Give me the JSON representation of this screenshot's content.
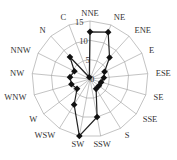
{
  "chart_data": {
    "type": "radar",
    "title": "",
    "categories": [
      "NNE",
      "NE",
      "ENE",
      "E",
      "ESE",
      "SE",
      "SSE",
      "S",
      "SSW",
      "SW",
      "WSW",
      "W",
      "WNW",
      "NW",
      "NNW",
      "N",
      "C"
    ],
    "series": [
      {
        "name": "frequency",
        "values": [
          12.2,
          13.0,
          7.5,
          4.2,
          3.6,
          3.0,
          2.9,
          3.0,
          10.0,
          15.0,
          7.8,
          4.2,
          5.0,
          5.2,
          4.5,
          7.7,
          0.5
        ],
        "marker": "diamond",
        "color": "#111111"
      }
    ],
    "radial_ticks": [
      0,
      5,
      10,
      15
    ],
    "radial_tick_labels": [
      "0",
      "5",
      "10",
      "15"
    ],
    "rlim": [
      0,
      15
    ],
    "grid": true,
    "grid_shape": "polygon",
    "legend": null,
    "start_angle_deg": 0,
    "direction": "clockwise"
  },
  "layout": {
    "cx": 90,
    "cy": 79,
    "radius": 58,
    "label_offset": 8,
    "colors": {
      "grid": "#9a9a9a",
      "series": "#222222",
      "marker": "#111111",
      "text": "#333333"
    }
  }
}
